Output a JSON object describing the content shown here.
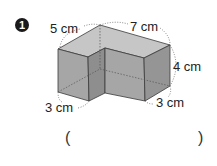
{
  "problem": {
    "number": "1",
    "labels": {
      "top_left": "5 cm",
      "top_right": "7 cm",
      "right_height": "4 cm",
      "bottom_left": "3 cm",
      "bottom_right": "3 cm"
    },
    "answer_blank": {
      "open": "(",
      "close": ")"
    },
    "colors": {
      "top_face": "#c6c6c6",
      "front_face": "#a6a6a6",
      "side_face": "#959595",
      "edge": "#3a3a3a"
    }
  }
}
